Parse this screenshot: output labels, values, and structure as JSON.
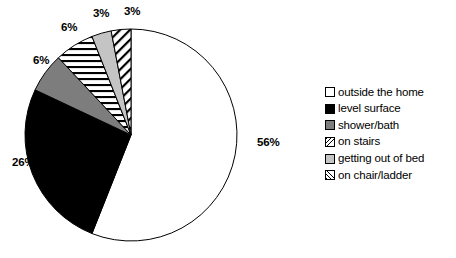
{
  "chart_data": {
    "type": "pie",
    "title": "",
    "subtitle": "",
    "xlabel": "",
    "ylabel": "",
    "legend_position": "right",
    "grid": false,
    "start_angle_deg": 0,
    "direction": "clockwise",
    "categories": [
      "outside the home",
      "level surface",
      "shower/bath",
      "on stairs",
      "getting out of bed",
      "on chair/ladder"
    ],
    "values": [
      56,
      26,
      6,
      6,
      3,
      3
    ],
    "data_labels": [
      "56%",
      "26%",
      "6%",
      "6%",
      "3%",
      "3%"
    ],
    "slice_styles": [
      "solid-white",
      "solid-black",
      "solid-gray",
      "horizontal-stripes",
      "solid-lightgray",
      "diagonal-stripes-forward"
    ],
    "colors": {
      "outside the home": "#ffffff",
      "level surface": "#000000",
      "shower/bath": "#7d7d7d",
      "on stairs": "#ffffff",
      "getting out of bed": "#c4c4c4",
      "on chair/ladder": "#ffffff",
      "outline": "#000000"
    }
  },
  "pie": {
    "center_x": 131,
    "center_y": 135,
    "radius": 106,
    "labels": [
      {
        "text": "56%",
        "x": 257,
        "y": 143
      },
      {
        "text": "26%",
        "x": 12,
        "y": 163
      },
      {
        "text": "6%",
        "x": 33,
        "y": 61
      },
      {
        "text": "6%",
        "x": 61,
        "y": 28
      },
      {
        "text": "3%",
        "x": 93,
        "y": 13
      },
      {
        "text": "3%",
        "x": 124,
        "y": 11
      }
    ]
  },
  "legend": {
    "items": [
      {
        "label": "outside the home",
        "swatch": "solid-white"
      },
      {
        "label": "level surface",
        "swatch": "solid-black"
      },
      {
        "label": "shower/bath",
        "swatch": "solid-gray"
      },
      {
        "label": "on stairs",
        "swatch": "hatch-back"
      },
      {
        "label": "getting out of bed",
        "swatch": "solid-lightgray"
      },
      {
        "label": "on chair/ladder",
        "swatch": "hatch-forward"
      }
    ]
  }
}
